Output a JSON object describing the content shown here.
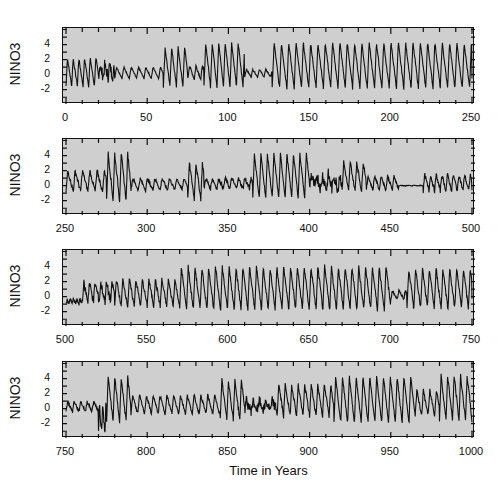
{
  "chart_data": {
    "type": "line",
    "title": "",
    "xlabel": "Time in Years",
    "ylabel": "NINO3",
    "ylim": [
      -3.9,
      6.2
    ],
    "yticks": [
      -2,
      0,
      2,
      4
    ],
    "ytick_labels": [
      "-2",
      "0",
      "2",
      "4"
    ],
    "grid": false,
    "legend": null,
    "panels": [
      {
        "xlim": [
          0,
          250
        ],
        "xticks": [
          0,
          50,
          100,
          150,
          200,
          250
        ],
        "xtick_labels": [
          "0",
          "50",
          "100",
          "150",
          "200",
          "250"
        ]
      },
      {
        "xlim": [
          250,
          500
        ],
        "xticks": [
          250,
          300,
          350,
          400,
          450,
          500
        ],
        "xtick_labels": [
          "250",
          "300",
          "350",
          "400",
          "450",
          "500"
        ]
      },
      {
        "xlim": [
          500,
          750
        ],
        "xticks": [
          500,
          550,
          600,
          650,
          700,
          750
        ],
        "xtick_labels": [
          "500",
          "550",
          "600",
          "650",
          "700",
          "750"
        ]
      },
      {
        "xlim": [
          750,
          1000
        ],
        "xticks": [
          750,
          800,
          850,
          900,
          950,
          1000
        ],
        "xtick_labels": [
          "750",
          "800",
          "850",
          "900",
          "950",
          "1000"
        ]
      }
    ],
    "series": [
      {
        "name": "NINO3",
        "description": "Oscillation envelope segments approximating the plotted NINO3 time series (year range, peak amplitude above zero, trough below zero, approx period in years, noise level)",
        "segments": [
          {
            "x0": 0,
            "x1": 20,
            "peak": 2.2,
            "trough": -1.5,
            "period": 3.5,
            "noise": 0.2
          },
          {
            "x0": 20,
            "x1": 30,
            "peak": 1.2,
            "trough": -0.3,
            "period": 3.0,
            "noise": 0.8
          },
          {
            "x0": 30,
            "x1": 60,
            "peak": 1.0,
            "trough": -0.5,
            "period": 4.5,
            "noise": 0.1
          },
          {
            "x0": 60,
            "x1": 75,
            "peak": 3.6,
            "trough": -1.6,
            "period": 4.0,
            "noise": 0.2
          },
          {
            "x0": 75,
            "x1": 85,
            "peak": 1.2,
            "trough": -0.6,
            "period": 4.0,
            "noise": 0.2
          },
          {
            "x0": 85,
            "x1": 110,
            "peak": 4.2,
            "trough": -1.6,
            "period": 4.0,
            "noise": 0.2
          },
          {
            "x0": 110,
            "x1": 127,
            "peak": 0.7,
            "trough": -0.3,
            "period": 4.0,
            "noise": 0.1
          },
          {
            "x0": 127,
            "x1": 250,
            "peak": 4.3,
            "trough": -1.8,
            "period": 4.5,
            "noise": 0.2
          },
          {
            "x0": 250,
            "x1": 275,
            "peak": 2.0,
            "trough": -0.8,
            "period": 4.5,
            "noise": 0.3
          },
          {
            "x0": 275,
            "x1": 290,
            "peak": 4.3,
            "trough": -2.0,
            "period": 4.0,
            "noise": 0.3
          },
          {
            "x0": 290,
            "x1": 325,
            "peak": 1.0,
            "trough": -0.6,
            "period": 4.5,
            "noise": 0.2
          },
          {
            "x0": 325,
            "x1": 335,
            "peak": 3.0,
            "trough": -1.8,
            "period": 4.0,
            "noise": 0.3
          },
          {
            "x0": 335,
            "x1": 365,
            "peak": 1.0,
            "trough": -0.4,
            "period": 4.0,
            "noise": 0.3
          },
          {
            "x0": 365,
            "x1": 400,
            "peak": 4.2,
            "trough": -1.6,
            "period": 4.0,
            "noise": 0.2
          },
          {
            "x0": 400,
            "x1": 420,
            "peak": 1.5,
            "trough": -0.5,
            "period": 3.5,
            "noise": 0.9
          },
          {
            "x0": 420,
            "x1": 435,
            "peak": 3.2,
            "trough": -0.8,
            "period": 4.0,
            "noise": 0.3
          },
          {
            "x0": 435,
            "x1": 455,
            "peak": 1.3,
            "trough": -0.6,
            "period": 4.0,
            "noise": 0.2
          },
          {
            "x0": 455,
            "x1": 470,
            "peak": 0.05,
            "trough": -0.05,
            "period": 4.0,
            "noise": 0.05
          },
          {
            "x0": 470,
            "x1": 500,
            "peak": 1.5,
            "trough": -0.7,
            "period": 3.5,
            "noise": 0.3
          },
          {
            "x0": 500,
            "x1": 510,
            "peak": -0.4,
            "trough": -0.9,
            "period": 2.0,
            "noise": 0.3
          },
          {
            "x0": 510,
            "x1": 530,
            "peak": 1.8,
            "trough": -0.6,
            "period": 3.5,
            "noise": 0.6
          },
          {
            "x0": 530,
            "x1": 570,
            "peak": 2.3,
            "trough": -1.3,
            "period": 4.0,
            "noise": 0.3
          },
          {
            "x0": 570,
            "x1": 700,
            "peak": 4.0,
            "trough": -1.8,
            "period": 4.2,
            "noise": 0.3
          },
          {
            "x0": 700,
            "x1": 710,
            "peak": 0.8,
            "trough": -0.3,
            "period": 4.0,
            "noise": 0.2
          },
          {
            "x0": 710,
            "x1": 750,
            "peak": 3.8,
            "trough": -1.6,
            "period": 4.2,
            "noise": 0.3
          },
          {
            "x0": 750,
            "x1": 770,
            "peak": 1.0,
            "trough": -0.4,
            "period": 4.0,
            "noise": 0.2
          },
          {
            "x0": 770,
            "x1": 775,
            "peak": 0.5,
            "trough": -3.0,
            "period": 2.0,
            "noise": 0.6
          },
          {
            "x0": 775,
            "x1": 790,
            "peak": 4.2,
            "trough": -1.8,
            "period": 4.0,
            "noise": 0.3
          },
          {
            "x0": 790,
            "x1": 845,
            "peak": 1.8,
            "trough": -0.7,
            "period": 4.2,
            "noise": 0.2
          },
          {
            "x0": 845,
            "x1": 860,
            "peak": 3.8,
            "trough": -1.5,
            "period": 4.0,
            "noise": 0.3
          },
          {
            "x0": 860,
            "x1": 880,
            "peak": 1.0,
            "trough": -0.3,
            "period": 4.0,
            "noise": 0.7
          },
          {
            "x0": 880,
            "x1": 915,
            "peak": 3.2,
            "trough": -1.0,
            "period": 4.0,
            "noise": 0.3
          },
          {
            "x0": 915,
            "x1": 965,
            "peak": 4.3,
            "trough": -1.9,
            "period": 4.2,
            "noise": 0.2
          },
          {
            "x0": 965,
            "x1": 980,
            "peak": 2.4,
            "trough": -0.8,
            "period": 4.0,
            "noise": 0.3
          },
          {
            "x0": 980,
            "x1": 1000,
            "peak": 4.4,
            "trough": -1.6,
            "period": 4.0,
            "noise": 0.3
          }
        ]
      }
    ]
  },
  "labels": {
    "ylabel": "NINO3",
    "xlabel": "Time in Years"
  }
}
